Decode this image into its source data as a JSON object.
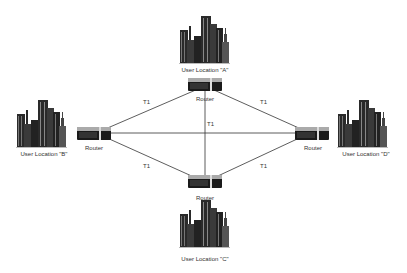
{
  "diagram": {
    "type": "network-topology",
    "link_label": "T1",
    "locations": [
      {
        "id": "A",
        "label": "User Location \"A\"",
        "router_label": "Router"
      },
      {
        "id": "B",
        "label": "User Location \"B\"",
        "router_label": "Router"
      },
      {
        "id": "C",
        "label": "User Location \"C\"",
        "router_label": "Router"
      },
      {
        "id": "D",
        "label": "User Location \"D\"",
        "router_label": "Router"
      }
    ],
    "links": [
      {
        "from": "A",
        "to": "B",
        "label": "T1"
      },
      {
        "from": "A",
        "to": "D",
        "label": "T1"
      },
      {
        "from": "A",
        "to": "C",
        "label": "T1"
      },
      {
        "from": "B",
        "to": "D",
        "label": ""
      },
      {
        "from": "B",
        "to": "C",
        "label": "T1"
      },
      {
        "from": "C",
        "to": "D",
        "label": "T1"
      }
    ],
    "colors": {
      "line": "#333333",
      "building": "#2a2a2a",
      "router": "#1a1a1a"
    }
  }
}
